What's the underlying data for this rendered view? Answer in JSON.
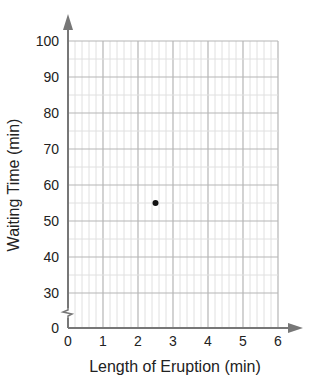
{
  "title_fragment": "Eruption Length vs. Waiting Time",
  "chart_data": {
    "type": "scatter",
    "title": "",
    "xlabel": "Length of Eruption (min)",
    "ylabel": "Waiting Time (min)",
    "xlim": [
      0,
      6
    ],
    "ylim": [
      0,
      100
    ],
    "y_axis_break": true,
    "x_ticks": [
      0,
      1,
      2,
      3,
      4,
      5,
      6
    ],
    "y_ticks": [
      0,
      30,
      40,
      50,
      60,
      70,
      80,
      90,
      100
    ],
    "x_minor_step": 0.2,
    "y_minor_step": 5,
    "grid": true,
    "points": [
      {
        "x": 2.5,
        "y": 55
      }
    ],
    "colors": {
      "grid_major": "#b5b5b5",
      "grid_minor": "#e0e0e0",
      "axis": "#777777",
      "point": "#111111"
    }
  }
}
